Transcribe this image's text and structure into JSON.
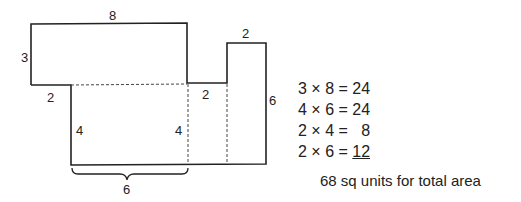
{
  "figure": {
    "type": "composite-area-diagram",
    "dimension_labels": {
      "top_width": "8",
      "left_height": "3",
      "left_step": "2",
      "inner_left_height": "4",
      "inner_right_height": "4",
      "bottom_brace": "6",
      "middle_step": "2",
      "tower_width": "2",
      "tower_height": "6"
    }
  },
  "calculations": [
    {
      "a": "3",
      "b": "8",
      "result": "24",
      "text": "3 × 8 = 24"
    },
    {
      "a": "4",
      "b": "6",
      "result": "24",
      "text": "4 × 6 = 24"
    },
    {
      "a": "2",
      "b": "4",
      "result": "8",
      "text": "2 × 4 =   8"
    },
    {
      "a": "2",
      "b": "6",
      "result": "12",
      "text": "2 × 6 = "
    }
  ],
  "last_result": "12",
  "total": "68 sq units for total area"
}
